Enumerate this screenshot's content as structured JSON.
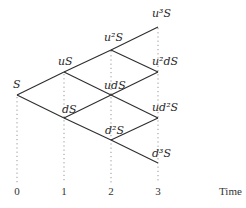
{
  "diagram": {
    "type": "binomial-tree",
    "steps": 3,
    "nodes": [
      {
        "id": "S",
        "label": "S",
        "time": 0
      },
      {
        "id": "uS",
        "label": "uS",
        "time": 1
      },
      {
        "id": "dS",
        "label": "dS",
        "time": 1
      },
      {
        "id": "u2S",
        "label": "u²S",
        "time": 2
      },
      {
        "id": "udS",
        "label": "udS",
        "time": 2
      },
      {
        "id": "d2S",
        "label": "d²S",
        "time": 2
      },
      {
        "id": "u3S",
        "label": "u³S",
        "time": 3
      },
      {
        "id": "u2dS",
        "label": "u²dS",
        "time": 3
      },
      {
        "id": "ud2S",
        "label": "ud²S",
        "time": 3
      },
      {
        "id": "d3S",
        "label": "d³S",
        "time": 3
      }
    ],
    "edges": [
      [
        "S",
        "uS"
      ],
      [
        "S",
        "dS"
      ],
      [
        "uS",
        "u2S"
      ],
      [
        "uS",
        "udS"
      ],
      [
        "dS",
        "udS"
      ],
      [
        "dS",
        "d2S"
      ],
      [
        "u2S",
        "u3S"
      ],
      [
        "u2S",
        "u2dS"
      ],
      [
        "udS",
        "u2dS"
      ],
      [
        "udS",
        "ud2S"
      ],
      [
        "d2S",
        "ud2S"
      ],
      [
        "d2S",
        "d3S"
      ]
    ],
    "axis": {
      "ticks": [
        "0",
        "1",
        "2",
        "3"
      ],
      "title": "Time"
    }
  }
}
